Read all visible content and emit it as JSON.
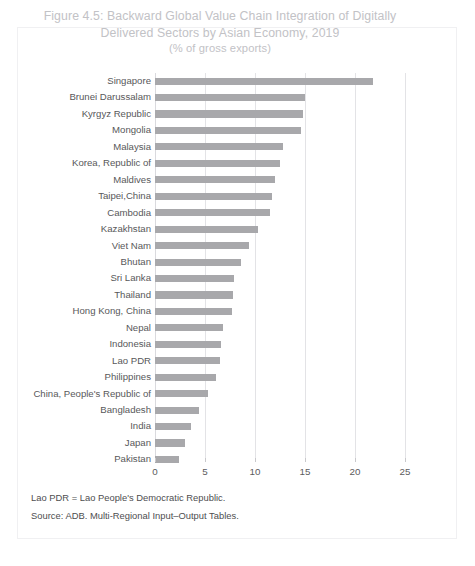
{
  "figure": {
    "title_line1": "Figure 4.5: Backward Global Value Chain Integration of Digitally",
    "title_line2": "Delivered Sectors by Asian Economy, 2019",
    "subtitle": "(% of gross exports)",
    "footnotes": [
      "Lao PDR = Lao People's Democratic Republic.",
      "Source: ADB. Multi-Regional Input–Output Tables."
    ]
  },
  "colors": {
    "bar": "#a8a8ab",
    "title": "#c2c2c6",
    "label": "#58585a",
    "gridline": "#e3e3e6",
    "frame": "#f0f0f2"
  },
  "chart_data": {
    "type": "bar",
    "orientation": "horizontal",
    "title": "Figure 4.5: Backward Global Value Chain Integration of Digitally Delivered Sectors by Asian Economy, 2019",
    "subtitle": "(% of gross exports)",
    "xlabel": "",
    "ylabel": "",
    "xlim": [
      0,
      25
    ],
    "xticks": [
      0,
      5,
      10,
      15,
      20,
      25
    ],
    "xtick_labels": [
      "0",
      "5",
      "10",
      "15",
      "20",
      "25"
    ],
    "grid": "vertical",
    "legend": "none",
    "categories": [
      "Singapore",
      "Brunei Darussalam",
      "Kyrgyz Republic",
      "Mongolia",
      "Malaysia",
      "Korea, Republic of",
      "Maldives",
      "Taipei,China",
      "Cambodia",
      "Kazakhstan",
      "Viet Nam",
      "Bhutan",
      "Sri Lanka",
      "Thailand",
      "Hong Kong, China",
      "Nepal",
      "Indonesia",
      "Lao PDR",
      "Philippines",
      "China, People's Republic of",
      "Bangladesh",
      "India",
      "Japan",
      "Pakistan"
    ],
    "values": [
      21.8,
      15.0,
      14.8,
      14.6,
      12.8,
      12.5,
      12.0,
      11.7,
      11.5,
      10.3,
      9.4,
      8.6,
      7.9,
      7.8,
      7.7,
      6.8,
      6.6,
      6.5,
      6.1,
      5.3,
      4.4,
      3.6,
      3.0,
      2.4
    ]
  }
}
